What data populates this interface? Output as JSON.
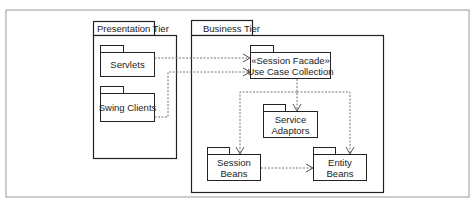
{
  "diagram": {
    "type": "UML package diagram",
    "tiers": [
      {
        "name": "Presentation Tier",
        "packages": [
          "Servlets",
          "Swing Clients"
        ]
      },
      {
        "name": "Business Tier",
        "packages": [
          "«Session Facade» Use Case Collection",
          "Service Adaptors",
          "Session Beans",
          "Entity Beans"
        ]
      }
    ],
    "labels": {
      "presentation_tier": "Presentation Tier",
      "business_tier": "Business Tier",
      "servlets": "Servlets",
      "swing_clients": "Swing Clients",
      "facade_line1": "«Session Facade»",
      "facade_line2": "Use Case Collection",
      "service_line1": "Service",
      "service_line2": "Adaptors",
      "session_line1": "Session",
      "session_line2": "Beans",
      "entity_line1": "Entity",
      "entity_line2": "Beans"
    },
    "dependencies": [
      {
        "from": "Servlets",
        "to": "«Session Facade» Use Case Collection"
      },
      {
        "from": "Swing Clients",
        "to": "«Session Facade» Use Case Collection"
      },
      {
        "from": "«Session Facade» Use Case Collection",
        "to": "Service Adaptors"
      },
      {
        "from": "«Session Facade» Use Case Collection",
        "to": "Session Beans"
      },
      {
        "from": "«Session Facade» Use Case Collection",
        "to": "Entity Beans"
      },
      {
        "from": "Session Beans",
        "to": "Entity Beans"
      }
    ],
    "colors": {
      "line": "#222222",
      "dashed": "#666666",
      "frame": "#999999"
    }
  }
}
